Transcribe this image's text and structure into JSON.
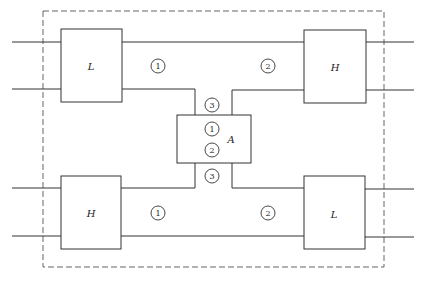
{
  "diagram": {
    "colors": {
      "line": "#333333",
      "border": "#555555",
      "background": "#ffffff"
    },
    "blocks": [
      {
        "id": "top-left",
        "label": "L"
      },
      {
        "id": "top-right",
        "label": "H"
      },
      {
        "id": "center",
        "label": "A"
      },
      {
        "id": "bottom-left",
        "label": "H"
      },
      {
        "id": "bottom-right",
        "label": "L"
      }
    ],
    "markers": [
      {
        "id": "top-left-channel",
        "text": "1"
      },
      {
        "id": "top-right-channel",
        "text": "2"
      },
      {
        "id": "center-top",
        "text": "3"
      },
      {
        "id": "center-inner-1",
        "text": "1"
      },
      {
        "id": "center-inner-2",
        "text": "2"
      },
      {
        "id": "center-bottom",
        "text": "3"
      },
      {
        "id": "bottom-left-channel",
        "text": "1"
      },
      {
        "id": "bottom-right-channel",
        "text": "2"
      }
    ]
  }
}
